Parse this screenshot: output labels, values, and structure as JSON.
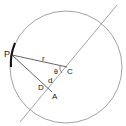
{
  "diagram": {
    "labels": {
      "P": "P",
      "r": "r",
      "theta": "θ",
      "C": "C",
      "d": "d",
      "D": "D",
      "A": "A"
    },
    "colors": {
      "stroke": "#8a8a8a",
      "radius_line": "#555555",
      "arc_highlight": "#111111",
      "text": "#222222"
    }
  }
}
